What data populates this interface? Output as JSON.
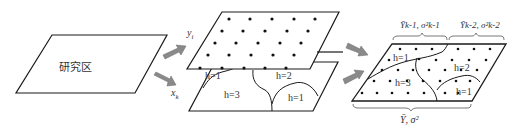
{
  "diagram": {
    "study_area": {
      "label": "研究区"
    },
    "arrows": {
      "to_y": {
        "label_var": "y",
        "label_sub": "i"
      },
      "to_x": {
        "label_var": "x",
        "label_sub": "k"
      }
    },
    "middle_layers": {
      "top_layer": {
        "description": "sample points y_i"
      },
      "bottom_layer": {
        "strata": [
          {
            "h": "h=1",
            "pos": "upper-left"
          },
          {
            "h": "h=3",
            "pos": "lower-left"
          },
          {
            "h": "h=2",
            "pos": "upper-right"
          },
          {
            "h": "h=1",
            "pos": "lower-right"
          }
        ]
      }
    },
    "result_layer": {
      "strata": [
        {
          "h": "h=1"
        },
        {
          "h": "h=3"
        },
        {
          "h": "h=2"
        },
        {
          "h": "h=1"
        }
      ],
      "brace_top_left": "Ȳk-1, σ²k-1",
      "brace_top_right": "Ȳk-2, σ²k-2",
      "brace_bottom": "Ȳ, σ²"
    },
    "colors": {
      "line": "#1a1a1a",
      "arrow_fill": "#8a8a8a",
      "dot": "#111111"
    }
  }
}
